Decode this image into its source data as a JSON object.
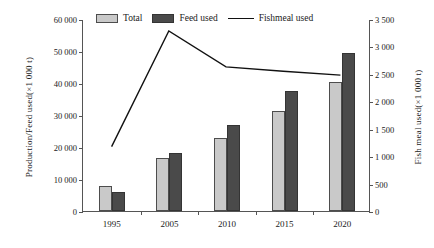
{
  "axes": {
    "left_title": "Production/Feed used(×1 000 t)",
    "right_title": "Fish meal used(×1 000 t)",
    "left_ticks": [
      "0",
      "10 000",
      "20 000",
      "30 000",
      "40 000",
      "50 000",
      "60 000"
    ],
    "right_ticks": [
      "0",
      "500",
      "1 000",
      "1 500",
      "2 000",
      "2 500",
      "3 000",
      "3 500"
    ],
    "x_ticks": [
      "1995",
      "2005",
      "2010",
      "2015",
      "2020"
    ]
  },
  "legend": {
    "items": [
      {
        "label": "Total",
        "marker": "swatch-light-gray",
        "color": "#c9c9c9"
      },
      {
        "label": "Feed used",
        "marker": "swatch-dark-gray",
        "color": "#4a4a4a"
      },
      {
        "label": "Fishmeal used",
        "marker": "line-black",
        "color": "#111111"
      }
    ]
  },
  "chart_data": {
    "type": "bar",
    "title": "",
    "xlabel": "",
    "ylabel": "Production/Feed used(×1 000 t)",
    "y2label": "Fish meal used(×1 000 t)",
    "categories": [
      "1995",
      "2005",
      "2010",
      "2015",
      "2020"
    ],
    "ylim": [
      0,
      60000
    ],
    "y2lim": [
      0,
      3500
    ],
    "ytick_step": 10000,
    "y2tick_step": 500,
    "grid": false,
    "legend_position": "top",
    "series": [
      {
        "name": "Total",
        "type": "bar",
        "axis": "left",
        "color": "#c9c9c9",
        "values": [
          7700,
          16500,
          22700,
          31200,
          40400
        ]
      },
      {
        "name": "Feed used",
        "type": "bar",
        "axis": "left",
        "color": "#4a4a4a",
        "values": [
          6000,
          18200,
          27000,
          37400,
          49500
        ]
      },
      {
        "name": "Fishmeal used",
        "type": "line",
        "axis": "right",
        "color": "#111111",
        "values": [
          1180,
          3300,
          2640,
          2560,
          2490
        ]
      }
    ]
  }
}
